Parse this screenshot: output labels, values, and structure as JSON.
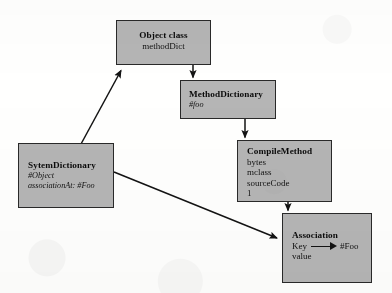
{
  "diagram": {
    "type": "uml-object-diagram",
    "background_color": "#fdfdfc",
    "node_fill_color": "#b4b4b4",
    "node_border_color": "#2b2b2b",
    "edge_color": "#151515",
    "nodes": [
      {
        "id": "object-class",
        "title": "Object class",
        "attributes": [
          "methodDict"
        ]
      },
      {
        "id": "method-dictionary",
        "title": "MethodDictionary",
        "attributes": [
          "#foo"
        ]
      },
      {
        "id": "compile-method",
        "title": "CompileMethod",
        "attributes": [
          "bytes",
          "mclass",
          "sourceCode",
          "1"
        ]
      },
      {
        "id": "sytem-dictionary",
        "title": "SytemDictionary",
        "attributes": [
          "#Object",
          "associationAt: #Foo"
        ]
      },
      {
        "id": "association",
        "title": "Association",
        "key_label": "Key",
        "key_value": "#Foo",
        "attributes": [
          "value"
        ]
      }
    ],
    "edges": [
      {
        "from": "object-class",
        "to": "method-dictionary"
      },
      {
        "from": "method-dictionary",
        "to": "compile-method"
      },
      {
        "from": "compile-method",
        "to": "association"
      },
      {
        "from": "sytem-dictionary",
        "to": "object-class"
      },
      {
        "from": "sytem-dictionary",
        "to": "association"
      }
    ]
  }
}
